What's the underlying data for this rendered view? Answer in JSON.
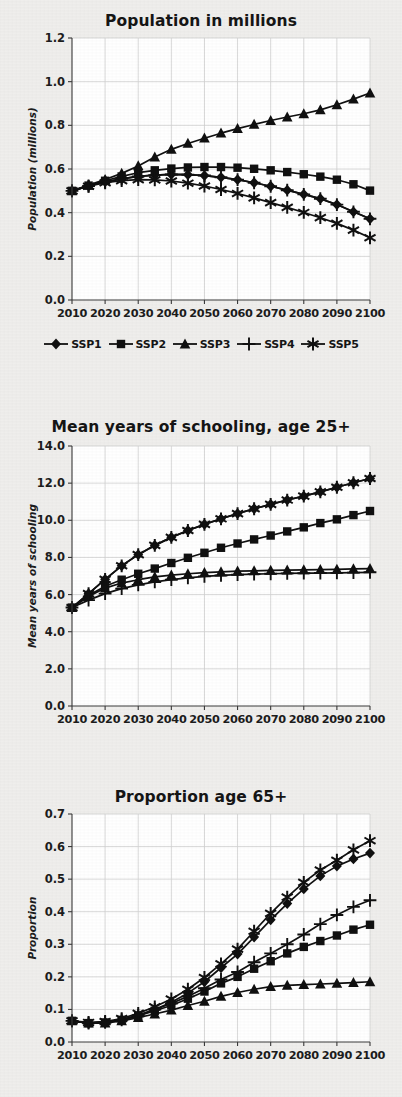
{
  "figure": {
    "background_color": "#efeeec",
    "plot_background_color": "#ffffff",
    "series_color": "#101010",
    "grid_color": "#cfcfcf"
  },
  "legend": {
    "position": "below-first-chart",
    "items": [
      {
        "label": "SSP1",
        "marker": "diamond-marker"
      },
      {
        "label": "SSP2",
        "marker": "square-marker"
      },
      {
        "label": "SSP3",
        "marker": "triangle-marker"
      },
      {
        "label": "SSP4",
        "marker": "plus-marker"
      },
      {
        "label": "SSP5",
        "marker": "asterisk-marker"
      }
    ]
  },
  "chart_data": [
    {
      "id": "population",
      "type": "line",
      "title": "Population in millions",
      "xlabel": "",
      "ylabel": "Population (millions)",
      "xlim": [
        2010,
        2100
      ],
      "ylim": [
        0.0,
        1.2
      ],
      "yticks": [
        "0.0",
        "0.2",
        "0.4",
        "0.6",
        "0.8",
        "1.0",
        "1.2"
      ],
      "ytick_values": [
        0.0,
        0.2,
        0.4,
        0.6,
        0.8,
        1.0,
        1.2
      ],
      "xticks": [
        "2010",
        "2020",
        "2030",
        "2040",
        "2050",
        "2060",
        "2070",
        "2080",
        "2090",
        "2100"
      ],
      "xtick_values": [
        2010,
        2020,
        2030,
        2040,
        2050,
        2060,
        2070,
        2080,
        2090,
        2100
      ],
      "grid": true,
      "legend_position": "bottom",
      "x": [
        2010,
        2015,
        2020,
        2025,
        2030,
        2035,
        2040,
        2045,
        2050,
        2055,
        2060,
        2065,
        2070,
        2075,
        2080,
        2085,
        2090,
        2095,
        2100
      ],
      "series": [
        {
          "name": "SSP1",
          "marker": "diamond-marker",
          "values": [
            0.5,
            0.522,
            0.541,
            0.555,
            0.566,
            0.572,
            0.575,
            0.574,
            0.57,
            0.562,
            0.551,
            0.537,
            0.521,
            0.503,
            0.484,
            0.464,
            0.437,
            0.404,
            0.372
          ]
        },
        {
          "name": "SSP2",
          "marker": "square-marker",
          "values": [
            0.5,
            0.524,
            0.546,
            0.566,
            0.583,
            0.594,
            0.602,
            0.607,
            0.609,
            0.609,
            0.606,
            0.601,
            0.594,
            0.586,
            0.576,
            0.565,
            0.551,
            0.53,
            0.501
          ]
        },
        {
          "name": "SSP3",
          "marker": "triangle-marker",
          "values": [
            0.5,
            0.526,
            0.552,
            0.58,
            0.614,
            0.655,
            0.69,
            0.717,
            0.741,
            0.764,
            0.785,
            0.804,
            0.822,
            0.838,
            0.853,
            0.871,
            0.894,
            0.92,
            0.948
          ]
        },
        {
          "name": "SSP4",
          "marker": "plus-marker",
          "values": [
            0.5,
            0.522,
            0.541,
            0.555,
            0.566,
            0.572,
            0.575,
            0.574,
            0.57,
            0.562,
            0.551,
            0.537,
            0.521,
            0.503,
            0.484,
            0.464,
            0.437,
            0.404,
            0.372
          ]
        },
        {
          "name": "SSP5",
          "marker": "asterisk-marker",
          "values": [
            0.5,
            0.521,
            0.537,
            0.547,
            0.551,
            0.55,
            0.545,
            0.535,
            0.522,
            0.506,
            0.488,
            0.468,
            0.446,
            0.424,
            0.401,
            0.377,
            0.351,
            0.32,
            0.285
          ]
        }
      ]
    },
    {
      "id": "schooling",
      "type": "line",
      "title": "Mean years of schooling, age 25+",
      "xlabel": "",
      "ylabel": "Mean years of schooling",
      "xlim": [
        2010,
        2100
      ],
      "ylim": [
        0.0,
        14.0
      ],
      "yticks": [
        "0.0",
        "2.0",
        "4.0",
        "6.0",
        "8.0",
        "10.0",
        "12.0",
        "14.0"
      ],
      "ytick_values": [
        0.0,
        2.0,
        4.0,
        6.0,
        8.0,
        10.0,
        12.0,
        14.0
      ],
      "xticks": [
        "2010",
        "2020",
        "2030",
        "2040",
        "2050",
        "2060",
        "2070",
        "2080",
        "2090",
        "2100"
      ],
      "xtick_values": [
        2010,
        2020,
        2030,
        2040,
        2050,
        2060,
        2070,
        2080,
        2090,
        2100
      ],
      "grid": true,
      "legend_position": "none",
      "x": [
        2010,
        2015,
        2020,
        2025,
        2030,
        2035,
        2040,
        2045,
        2050,
        2055,
        2060,
        2065,
        2070,
        2075,
        2080,
        2085,
        2090,
        2095,
        2100
      ],
      "series": [
        {
          "name": "SSP1",
          "marker": "diamond-marker",
          "values": [
            5.3,
            6.05,
            6.82,
            7.55,
            8.15,
            8.65,
            9.08,
            9.45,
            9.78,
            10.08,
            10.36,
            10.62,
            10.86,
            11.09,
            11.3,
            11.53,
            11.78,
            12.02,
            12.25
          ]
        },
        {
          "name": "SSP2",
          "marker": "square-marker",
          "values": [
            5.3,
            5.95,
            6.45,
            6.8,
            7.12,
            7.4,
            7.7,
            7.98,
            8.25,
            8.52,
            8.75,
            8.97,
            9.18,
            9.4,
            9.62,
            9.85,
            10.05,
            10.28,
            10.5
          ]
        },
        {
          "name": "SSP3",
          "marker": "triangle-marker",
          "values": [
            5.3,
            5.9,
            6.35,
            6.62,
            6.8,
            6.95,
            7.05,
            7.12,
            7.18,
            7.22,
            7.26,
            7.28,
            7.3,
            7.32,
            7.33,
            7.34,
            7.36,
            7.38,
            7.4
          ]
        },
        {
          "name": "SSP4",
          "marker": "plus-marker",
          "values": [
            5.3,
            5.7,
            6.05,
            6.32,
            6.52,
            6.68,
            6.8,
            6.9,
            6.98,
            7.03,
            7.07,
            7.1,
            7.12,
            7.14,
            7.15,
            7.16,
            7.17,
            7.18,
            7.2
          ]
        },
        {
          "name": "SSP5",
          "marker": "asterisk-marker",
          "values": [
            5.3,
            6.05,
            6.82,
            7.55,
            8.15,
            8.65,
            9.08,
            9.45,
            9.78,
            10.08,
            10.36,
            10.62,
            10.86,
            11.09,
            11.3,
            11.53,
            11.78,
            12.02,
            12.25
          ]
        }
      ]
    },
    {
      "id": "proportion",
      "type": "line",
      "title": "Proportion age 65+",
      "xlabel": "",
      "ylabel": "Proportion",
      "xlim": [
        2010,
        2100
      ],
      "ylim": [
        0.0,
        0.7
      ],
      "yticks": [
        "0.0",
        "0.1",
        "0.2",
        "0.3",
        "0.4",
        "0.5",
        "0.6",
        "0.7"
      ],
      "ytick_values": [
        0.0,
        0.1,
        0.2,
        0.3,
        0.4,
        0.5,
        0.6,
        0.7
      ],
      "xticks": [
        "2010",
        "2020",
        "2030",
        "2040",
        "2050",
        "2060",
        "2070",
        "2080",
        "2090",
        "2100"
      ],
      "xtick_values": [
        2010,
        2020,
        2030,
        2040,
        2050,
        2060,
        2070,
        2080,
        2090,
        2100
      ],
      "grid": true,
      "legend_position": "none",
      "x": [
        2010,
        2015,
        2020,
        2025,
        2030,
        2035,
        2040,
        2045,
        2050,
        2055,
        2060,
        2065,
        2070,
        2075,
        2080,
        2085,
        2090,
        2095,
        2100
      ],
      "series": [
        {
          "name": "SSP1",
          "marker": "diamond-marker",
          "values": [
            0.065,
            0.058,
            0.06,
            0.068,
            0.082,
            0.1,
            0.122,
            0.15,
            0.185,
            0.228,
            0.27,
            0.322,
            0.375,
            0.425,
            0.47,
            0.51,
            0.54,
            0.562,
            0.58
          ]
        },
        {
          "name": "SSP2",
          "marker": "square-marker",
          "values": [
            0.065,
            0.058,
            0.06,
            0.068,
            0.08,
            0.096,
            0.112,
            0.133,
            0.155,
            0.18,
            0.2,
            0.225,
            0.248,
            0.272,
            0.292,
            0.31,
            0.327,
            0.345,
            0.36
          ]
        },
        {
          "name": "SSP3",
          "marker": "triangle-marker",
          "values": [
            0.065,
            0.058,
            0.058,
            0.065,
            0.075,
            0.086,
            0.098,
            0.112,
            0.125,
            0.14,
            0.152,
            0.162,
            0.17,
            0.174,
            0.176,
            0.178,
            0.18,
            0.182,
            0.185
          ]
        },
        {
          "name": "SSP4",
          "marker": "plus-marker",
          "values": [
            0.065,
            0.058,
            0.06,
            0.068,
            0.082,
            0.1,
            0.118,
            0.14,
            0.165,
            0.192,
            0.215,
            0.245,
            0.272,
            0.3,
            0.33,
            0.362,
            0.39,
            0.415,
            0.435
          ]
        },
        {
          "name": "SSP5",
          "marker": "asterisk-marker",
          "values": [
            0.065,
            0.06,
            0.063,
            0.072,
            0.088,
            0.108,
            0.132,
            0.162,
            0.198,
            0.24,
            0.285,
            0.34,
            0.395,
            0.445,
            0.49,
            0.528,
            0.558,
            0.59,
            0.618
          ]
        }
      ]
    }
  ]
}
